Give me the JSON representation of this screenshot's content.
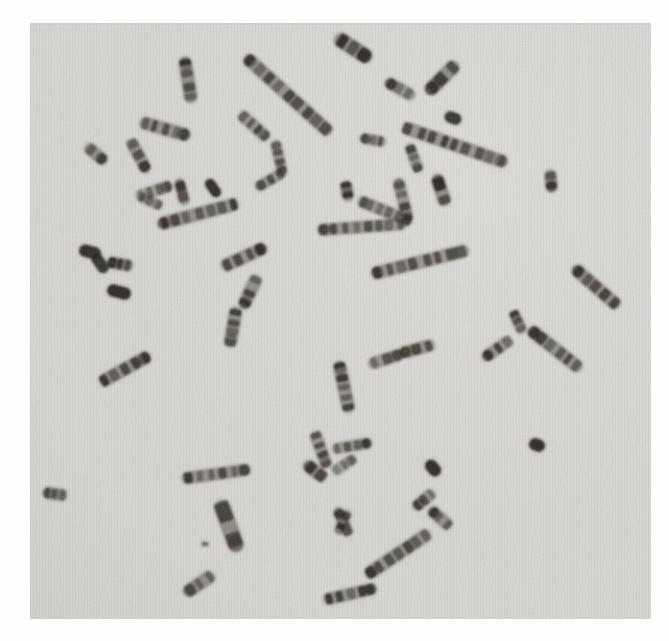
{
  "figure": {
    "piece_count": 59
  },
  "palette": {
    "page_background": "#fefefd",
    "photo_background": "#d7d6d2",
    "photo_edge_tint": "#cfcecb",
    "chromatin_dark": "#181410",
    "chromatin_mid": "#544c44",
    "stripe_tint": "rgba(80,80,75,0.055)"
  },
  "photo_frame": {
    "left": 30,
    "top": 23,
    "right": 651,
    "bottom": 619
  },
  "chromosomes": [
    {
      "cx": 188,
      "cy": 80,
      "len": 46,
      "w": 13,
      "angle": 81,
      "bands": 4,
      "shade": 0.88
    },
    {
      "cx": 288,
      "cy": 95,
      "len": 115,
      "w": 13,
      "angle": 42,
      "bands": 9,
      "shade": 0.8
    },
    {
      "cx": 165,
      "cy": 129,
      "len": 52,
      "w": 13,
      "angle": 16,
      "bands": 5,
      "shade": 0.8
    },
    {
      "cx": 139,
      "cy": 156,
      "len": 36,
      "w": 12,
      "angle": 62,
      "bands": 3,
      "shade": 0.78
    },
    {
      "cx": 96,
      "cy": 154,
      "len": 26,
      "w": 12,
      "angle": 40,
      "bands": 2,
      "shade": 0.88
    },
    {
      "cx": 154,
      "cy": 191,
      "len": 38,
      "w": 12,
      "angle": -18,
      "bands": 4,
      "shade": 0.55
    },
    {
      "cx": 150,
      "cy": 201,
      "len": 26,
      "w": 11,
      "angle": 25,
      "bands": 3,
      "shade": 0.5
    },
    {
      "cx": 182,
      "cy": 192,
      "len": 26,
      "w": 11,
      "angle": 75,
      "bands": 2,
      "shade": 0.85
    },
    {
      "cx": 213,
      "cy": 188,
      "len": 20,
      "w": 11,
      "angle": 55,
      "bands": 0,
      "shade": 0.9
    },
    {
      "cx": 198,
      "cy": 214,
      "len": 83,
      "w": 13,
      "angle": -15,
      "bands": 7,
      "shade": 0.8
    },
    {
      "cx": 90,
      "cy": 252,
      "len": 22,
      "w": 13,
      "angle": 15,
      "bands": 0,
      "shade": 0.88
    },
    {
      "cx": 100,
      "cy": 263,
      "len": 22,
      "w": 12,
      "angle": 55,
      "bands": 0,
      "shade": 0.85
    },
    {
      "cx": 120,
      "cy": 264,
      "len": 26,
      "w": 12,
      "angle": 10,
      "bands": 3,
      "shade": 0.8
    },
    {
      "cx": 119,
      "cy": 292,
      "len": 24,
      "w": 13,
      "angle": 15,
      "bands": 0,
      "shade": 0.92
    },
    {
      "cx": 254,
      "cy": 126,
      "len": 38,
      "w": 12,
      "angle": 42,
      "bands": 4,
      "shade": 0.75
    },
    {
      "cx": 279,
      "cy": 158,
      "len": 36,
      "w": 11,
      "angle": 77,
      "bands": 4,
      "shade": 0.7
    },
    {
      "cx": 270,
      "cy": 180,
      "len": 32,
      "w": 11,
      "angle": -30,
      "bands": 3,
      "shade": 0.7
    },
    {
      "cx": 244,
      "cy": 257,
      "len": 49,
      "w": 13,
      "angle": -25,
      "bands": 4,
      "shade": 0.8
    },
    {
      "cx": 250,
      "cy": 292,
      "len": 36,
      "w": 13,
      "angle": 115,
      "bands": 3,
      "shade": 0.85
    },
    {
      "cx": 233,
      "cy": 327,
      "len": 40,
      "w": 13,
      "angle": 100,
      "bands": 4,
      "shade": 0.8
    },
    {
      "cx": 353,
      "cy": 48,
      "len": 42,
      "w": 15,
      "angle": 33,
      "bands": 3,
      "shade": 0.9
    },
    {
      "cx": 442,
      "cy": 78,
      "len": 43,
      "w": 14,
      "angle": -45,
      "bands": 3,
      "shade": 0.85
    },
    {
      "cx": 400,
      "cy": 89,
      "len": 33,
      "w": 12,
      "angle": 29,
      "bands": 3,
      "shade": 0.72
    },
    {
      "cx": 453,
      "cy": 118,
      "len": 17,
      "w": 12,
      "angle": 20,
      "bands": 0,
      "shade": 0.85
    },
    {
      "cx": 455,
      "cy": 145,
      "len": 110,
      "w": 13,
      "angle": 19,
      "bands": 9,
      "shade": 0.8
    },
    {
      "cx": 373,
      "cy": 140,
      "len": 26,
      "w": 11,
      "angle": 10,
      "bands": 3,
      "shade": 0.7
    },
    {
      "cx": 414,
      "cy": 158,
      "len": 30,
      "w": 11,
      "angle": 70,
      "bands": 3,
      "shade": 0.72
    },
    {
      "cx": 403,
      "cy": 200,
      "len": 44,
      "w": 12,
      "angle": 76,
      "bands": 4,
      "shade": 0.75
    },
    {
      "cx": 441,
      "cy": 190,
      "len": 32,
      "w": 13,
      "angle": 72,
      "bands": 2,
      "shade": 0.9
    },
    {
      "cx": 347,
      "cy": 191,
      "len": 20,
      "w": 12,
      "angle": 80,
      "bands": 2,
      "shade": 0.85
    },
    {
      "cx": 385,
      "cy": 211,
      "len": 58,
      "w": 12,
      "angle": 22,
      "bands": 6,
      "shade": 0.75
    },
    {
      "cx": 362,
      "cy": 227,
      "len": 88,
      "w": 12,
      "angle": -4,
      "bands": 8,
      "shade": 0.78
    },
    {
      "cx": 420,
      "cy": 262,
      "len": 100,
      "w": 13,
      "angle": -14,
      "bands": 8,
      "shade": 0.76
    },
    {
      "cx": 551,
      "cy": 181,
      "len": 22,
      "w": 12,
      "angle": 85,
      "bands": 2,
      "shade": 0.92
    },
    {
      "cx": 596,
      "cy": 287,
      "len": 60,
      "w": 13,
      "angle": 41,
      "bands": 5,
      "shade": 0.82
    },
    {
      "cx": 518,
      "cy": 322,
      "len": 24,
      "w": 11,
      "angle": 65,
      "bands": 3,
      "shade": 0.75
    },
    {
      "cx": 555,
      "cy": 349,
      "len": 66,
      "w": 13,
      "angle": 38,
      "bands": 6,
      "shade": 0.8
    },
    {
      "cx": 497,
      "cy": 349,
      "len": 34,
      "w": 12,
      "angle": -35,
      "bands": 3,
      "shade": 0.75
    },
    {
      "cx": 537,
      "cy": 445,
      "len": 16,
      "w": 13,
      "angle": 20,
      "bands": 0,
      "shade": 0.9
    },
    {
      "cx": 125,
      "cy": 369,
      "len": 57,
      "w": 13,
      "angle": -29,
      "bands": 5,
      "shade": 0.8
    },
    {
      "cx": 55,
      "cy": 494,
      "len": 24,
      "w": 12,
      "angle": 8,
      "bands": 3,
      "shade": 0.8
    },
    {
      "cx": 216,
      "cy": 474,
      "len": 69,
      "w": 12,
      "angle": -8,
      "bands": 6,
      "shade": 0.8
    },
    {
      "cx": 229,
      "cy": 526,
      "len": 54,
      "w": 16,
      "angle": 70,
      "bands": 2,
      "shade": 0.9
    },
    {
      "cx": 199,
      "cy": 584,
      "len": 35,
      "w": 13,
      "angle": -34,
      "bands": 3,
      "shade": 0.85
    },
    {
      "cx": 321,
      "cy": 450,
      "len": 38,
      "w": 12,
      "angle": 70,
      "bands": 4,
      "shade": 0.75
    },
    {
      "cx": 315,
      "cy": 471,
      "len": 26,
      "w": 13,
      "angle": 38,
      "bands": 2,
      "shade": 0.85
    },
    {
      "cx": 344,
      "cy": 465,
      "len": 27,
      "w": 11,
      "angle": -33,
      "bands": 3,
      "shade": 0.55
    },
    {
      "cx": 352,
      "cy": 446,
      "len": 40,
      "w": 11,
      "angle": -10,
      "bands": 4,
      "shade": 0.7
    },
    {
      "cx": 344,
      "cy": 387,
      "len": 52,
      "w": 13,
      "angle": 78,
      "bands": 5,
      "shade": 0.8
    },
    {
      "cx": 386,
      "cy": 359,
      "len": 36,
      "w": 12,
      "angle": -18,
      "bands": 3,
      "shade": 0.75
    },
    {
      "cx": 417,
      "cy": 349,
      "len": 36,
      "w": 12,
      "angle": -15,
      "bands": 3,
      "shade": 0.8
    },
    {
      "cx": 424,
      "cy": 500,
      "len": 26,
      "w": 12,
      "angle": -40,
      "bands": 3,
      "shade": 0.75
    },
    {
      "cx": 440,
      "cy": 518,
      "len": 28,
      "w": 12,
      "angle": 42,
      "bands": 3,
      "shade": 0.8
    },
    {
      "cx": 433,
      "cy": 468,
      "len": 18,
      "w": 13,
      "angle": 50,
      "bands": 0,
      "shade": 0.9
    },
    {
      "cx": 343,
      "cy": 522,
      "len": 30,
      "w": 11,
      "angle": 65,
      "bands": 2,
      "shade": 0.8
    },
    {
      "cx": 343,
      "cy": 522,
      "len": 26,
      "w": 10,
      "angle": 115,
      "bands": 2,
      "shade": 0.7
    },
    {
      "cx": 398,
      "cy": 554,
      "len": 77,
      "w": 13,
      "angle": -34,
      "bands": 7,
      "shade": 0.8
    },
    {
      "cx": 350,
      "cy": 594,
      "len": 54,
      "w": 12,
      "angle": -13,
      "bands": 5,
      "shade": 0.8
    },
    {
      "cx": 205,
      "cy": 544,
      "len": 7,
      "w": 5,
      "angle": 0,
      "bands": 0,
      "shade": 0.5
    }
  ]
}
